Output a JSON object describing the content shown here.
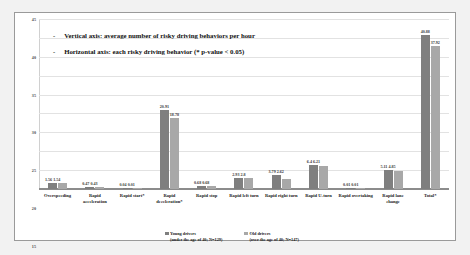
{
  "notes": [
    {
      "dash": "-",
      "text": "Vertical axis: average number of risky driving behaviors per hour"
    },
    {
      "dash": "-",
      "text": "Horizontal axis: each risky driving behavior (* p-value < 0.05)"
    }
  ],
  "legend": [
    {
      "swatch": "young-series-swatch",
      "line1": "Young drivers",
      "line2": "(under the age of 40; N=129)",
      "color": "#7f7f7f"
    },
    {
      "swatch": "old-series-swatch",
      "line1": "Old drivers",
      "line2": "(over the age of 40; N=147)",
      "color": "#a8a8a8"
    }
  ],
  "chart_data": {
    "type": "bar",
    "title": "",
    "xlabel": "each risky driving behavior (* p-value < 0.05)",
    "ylabel": "average number of risky driving behaviors per hour",
    "ylim": [
      0,
      45
    ],
    "yticks": [
      0,
      5,
      10,
      15,
      20,
      25,
      30,
      35,
      40,
      45
    ],
    "ytick_labels": [
      "0",
      "5",
      "10",
      "15",
      "20",
      "25",
      "30",
      "35",
      "40",
      "45"
    ],
    "grid": true,
    "legend_position": "bottom",
    "categories": [
      "Overspeeding",
      "Rapid acceleration",
      "Rapid start*",
      "Rapid deceleration*",
      "Rapid stop",
      "Rapid left turn",
      "Rapid right turn",
      "Rapid U-turn",
      "Rapid overtaking",
      "Rapid lane change",
      "Total*"
    ],
    "series": [
      {
        "name": "Young drivers (under the age of 40; N=129)",
        "color": "#7f7f7f",
        "values": [
          1.56,
          0.47,
          0.04,
          20.91,
          0.68,
          2.93,
          3.79,
          6.4,
          0.01,
          5.11,
          40.88
        ],
        "labels": [
          "1.56",
          "0.47",
          "0.04",
          "20.91",
          "0.68",
          "2.93",
          "3.79",
          "6.4",
          "0.01",
          "5.11",
          "40.88"
        ]
      },
      {
        "name": "Old drivers (over the age of 40; N=147)",
        "color": "#a8a8a8",
        "values": [
          1.54,
          0.43,
          0.01,
          18.78,
          0.68,
          2.8,
          2.62,
          6.21,
          0.01,
          4.85,
          37.92
        ],
        "labels": [
          "1.54",
          "0.43",
          "0.01",
          "18.78",
          "0.68",
          "2.8",
          "2.62",
          "6.21",
          "0.01",
          "4.85",
          "37.92"
        ]
      }
    ]
  }
}
